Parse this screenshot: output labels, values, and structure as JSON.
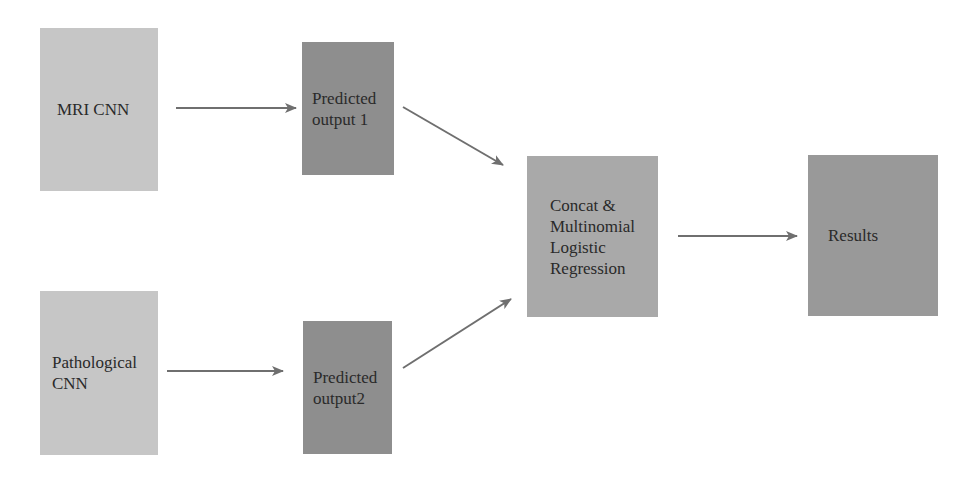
{
  "diagram": {
    "nodes": [
      {
        "id": "mri_cnn",
        "label": "MRI CNN",
        "color": "#c6c6c6"
      },
      {
        "id": "pred1",
        "label": "Predicted\noutput 1",
        "color": "#8e8e8e"
      },
      {
        "id": "path_cnn",
        "label": "Pathological\nCNN",
        "color": "#c6c6c6"
      },
      {
        "id": "pred2",
        "label": "Predicted\noutput2",
        "color": "#8e8e8e"
      },
      {
        "id": "concat",
        "label": "Concat &\nMultinomial\nLogistic\nRegression",
        "color": "#a9a9a9"
      },
      {
        "id": "results",
        "label": "Results",
        "color": "#999999"
      }
    ],
    "edges": [
      {
        "from": "mri_cnn",
        "to": "pred1"
      },
      {
        "from": "path_cnn",
        "to": "pred2"
      },
      {
        "from": "pred1",
        "to": "concat"
      },
      {
        "from": "pred2",
        "to": "concat"
      },
      {
        "from": "concat",
        "to": "results"
      }
    ],
    "arrow_color": "#6f6f6f"
  }
}
